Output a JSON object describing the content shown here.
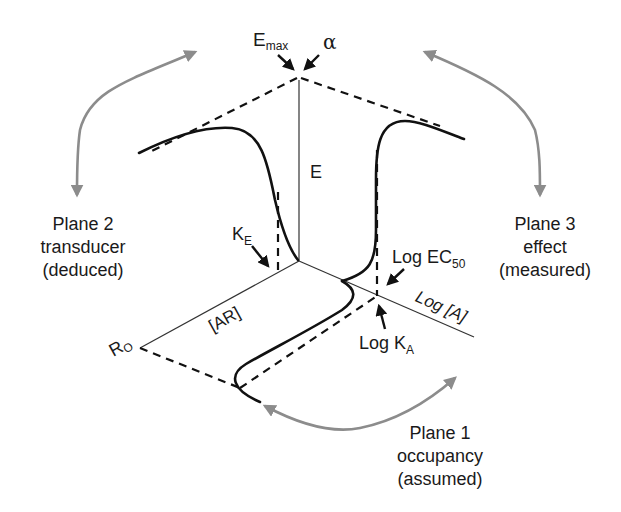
{
  "diagram": {
    "axis_labels": {
      "effect": "E",
      "agonist": "Log [A]",
      "complex": "[AR]",
      "receptor_total": "R",
      "receptor_total_sub": "O"
    },
    "annotations": {
      "emax": "E",
      "emax_sub": "max",
      "alpha": "α",
      "ke": "K",
      "ke_sub": "E",
      "log_ec50": "Log EC",
      "log_ec50_sub": "50",
      "log_ka": "Log K",
      "log_ka_sub": "A"
    },
    "planes": [
      {
        "id": 1,
        "lines": [
          "Plane 1",
          "occupancy",
          "(assumed)"
        ]
      },
      {
        "id": 2,
        "lines": [
          "Plane 2",
          "transducer",
          "(deduced)"
        ]
      },
      {
        "id": 3,
        "lines": [
          "Plane 3",
          "effect",
          "(measured)"
        ]
      }
    ],
    "colors": {
      "curve": "#111111",
      "axis": "#333333",
      "plane_arrow": "#8c8c8c"
    }
  }
}
